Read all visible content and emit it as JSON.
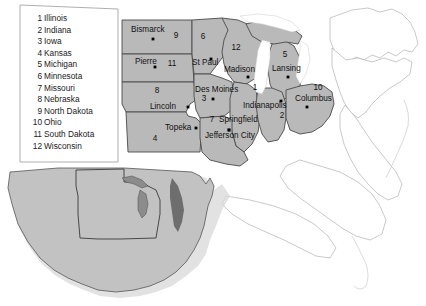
{
  "map": {
    "title": "Midwest United States reference map",
    "colors": {
      "highlight_fill": "#b9b9b9",
      "highlight_stroke": "#4a4a4a",
      "outside_fill": "#ffffff",
      "outside_stroke": "#b0b0b0",
      "inset_fill": "#c2c2c2",
      "inset_stroke": "#555555",
      "lake_fill": "#ffffff",
      "legend_fill": "#ffffff",
      "legend_stroke": "#9a9a9a",
      "text": "#111111"
    }
  },
  "legend": {
    "items": [
      {
        "num": "1",
        "name": "Illinois"
      },
      {
        "num": "2",
        "name": "Indiana"
      },
      {
        "num": "3",
        "name": "Iowa"
      },
      {
        "num": "4",
        "name": "Kansas"
      },
      {
        "num": "5",
        "name": "Michigan"
      },
      {
        "num": "6",
        "name": "Minnesota"
      },
      {
        "num": "7",
        "name": "Missouri"
      },
      {
        "num": "8",
        "name": "Nebraska"
      },
      {
        "num": "9",
        "name": "North Dakota"
      },
      {
        "num": "10",
        "name": "Ohio"
      },
      {
        "num": "11",
        "name": "South Dakota"
      },
      {
        "num": "12",
        "name": "Wisconsin"
      }
    ]
  },
  "state_numbers": [
    {
      "label": "9",
      "x": 176,
      "y": 38,
      "state": "north-dakota"
    },
    {
      "label": "6",
      "x": 203,
      "y": 39,
      "state": "minnesota"
    },
    {
      "label": "12",
      "x": 236,
      "y": 50,
      "state": "wisconsin"
    },
    {
      "label": "5",
      "x": 285,
      "y": 57,
      "state": "michigan"
    },
    {
      "label": "11",
      "x": 172,
      "y": 66,
      "state": "south-dakota"
    },
    {
      "label": "8",
      "x": 157,
      "y": 93,
      "state": "nebraska"
    },
    {
      "label": "3",
      "x": 204,
      "y": 101,
      "state": "iowa"
    },
    {
      "label": "1",
      "x": 255,
      "y": 90,
      "state": "illinois"
    },
    {
      "label": "10",
      "x": 318,
      "y": 90,
      "state": "ohio"
    },
    {
      "label": "2",
      "x": 282,
      "y": 118,
      "state": "indiana"
    },
    {
      "label": "7",
      "x": 212,
      "y": 122,
      "state": "missouri"
    },
    {
      "label": "4",
      "x": 155,
      "y": 141,
      "state": "kansas"
    }
  ],
  "cities": [
    {
      "name": "Bismarck",
      "label_x": 131,
      "label_y": 32,
      "dot_x": 153,
      "dot_y": 39,
      "anchor": "start"
    },
    {
      "name": "Pierre",
      "label_x": 135,
      "label_y": 64,
      "dot_x": 155,
      "dot_y": 67,
      "anchor": "start"
    },
    {
      "name": "St Paul",
      "label_x": 192,
      "label_y": 65,
      "dot_x": 211,
      "dot_y": 59,
      "anchor": "start"
    },
    {
      "name": "Madison",
      "label_x": 224,
      "label_y": 72,
      "dot_x": 248,
      "dot_y": 77,
      "anchor": "start"
    },
    {
      "name": "Lansing",
      "label_x": 272,
      "label_y": 71,
      "dot_x": 288,
      "dot_y": 77,
      "anchor": "start"
    },
    {
      "name": "Des Moines",
      "label_x": 195,
      "label_y": 92,
      "dot_x": 213,
      "dot_y": 99,
      "anchor": "start"
    },
    {
      "name": "Indianapolis",
      "label_x": 243,
      "label_y": 108,
      "dot_x": 281,
      "dot_y": 101,
      "anchor": "start"
    },
    {
      "name": "Columbus",
      "label_x": 295,
      "label_y": 101,
      "dot_x": 307,
      "dot_y": 107,
      "anchor": "start"
    },
    {
      "name": "Lincoln",
      "label_x": 150,
      "label_y": 109,
      "dot_x": 188,
      "dot_y": 107,
      "anchor": "start"
    },
    {
      "name": "Springfield",
      "label_x": 219,
      "label_y": 122,
      "dot_x": 229,
      "dot_y": 130,
      "anchor": "start"
    },
    {
      "name": "Topeka",
      "label_x": 165,
      "label_y": 130,
      "dot_x": 196,
      "dot_y": 128,
      "anchor": "start"
    },
    {
      "name": "Jefferson City",
      "label_x": 205,
      "label_y": 138,
      "dot_x": 229,
      "dot_y": 130,
      "anchor": "start"
    }
  ],
  "inset": {
    "name": "United States locator inset",
    "region_outlined": "Midwest"
  }
}
